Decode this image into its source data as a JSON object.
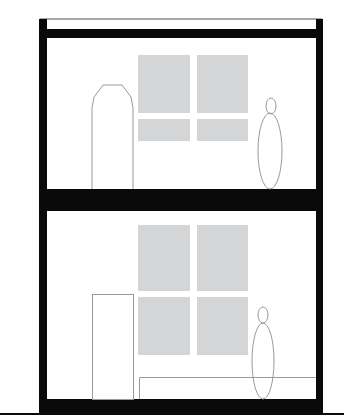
{
  "diagram": {
    "type": "architectural-section",
    "colors": {
      "structure": "#0a0a0a",
      "outline": "#9a9a9a",
      "glass": "#d4d5d7",
      "parapet_line": "#a0a0a0",
      "background": "#ffffff"
    },
    "floors": [
      {
        "name": "upper-floor",
        "door": "chamfered-top opening",
        "window_panes": 4,
        "figures": 1
      },
      {
        "name": "lower-floor",
        "door": "rectangular door",
        "window_panes": 4,
        "figures": 1,
        "furniture": "bench"
      }
    ]
  }
}
